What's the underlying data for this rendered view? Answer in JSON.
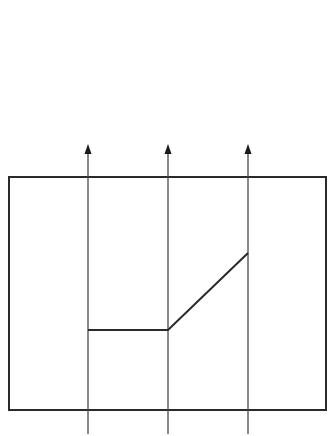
{
  "canvas": {
    "width": 331,
    "height": 436,
    "background": "#ffffff"
  },
  "colors": {
    "frame": "#2a2a2a",
    "axis": "#4a4a4a",
    "profile": "#2a2a2a",
    "arrowhead": "#1a1a1a"
  },
  "frame": {
    "x": 9,
    "y": 177,
    "width": 317,
    "height": 233,
    "stroke_width": 2
  },
  "vertical_arrows": [
    {
      "id": "arrow-1",
      "x": 88,
      "y_bottom": 434,
      "y_tip": 144
    },
    {
      "id": "arrow-2",
      "x": 168,
      "y_bottom": 434,
      "y_tip": 144
    },
    {
      "id": "arrow-3",
      "x": 248,
      "y_bottom": 434,
      "y_tip": 144
    }
  ],
  "profile": {
    "points": [
      [
        88,
        330
      ],
      [
        168,
        330
      ],
      [
        248,
        253
      ]
    ],
    "stroke_width": 2,
    "segments": [
      {
        "name": "flat-segment",
        "from": [
          88,
          330
        ],
        "to": [
          168,
          330
        ]
      },
      {
        "name": "rising-segment",
        "from": [
          168,
          330
        ],
        "to": [
          248,
          253
        ]
      }
    ]
  }
}
